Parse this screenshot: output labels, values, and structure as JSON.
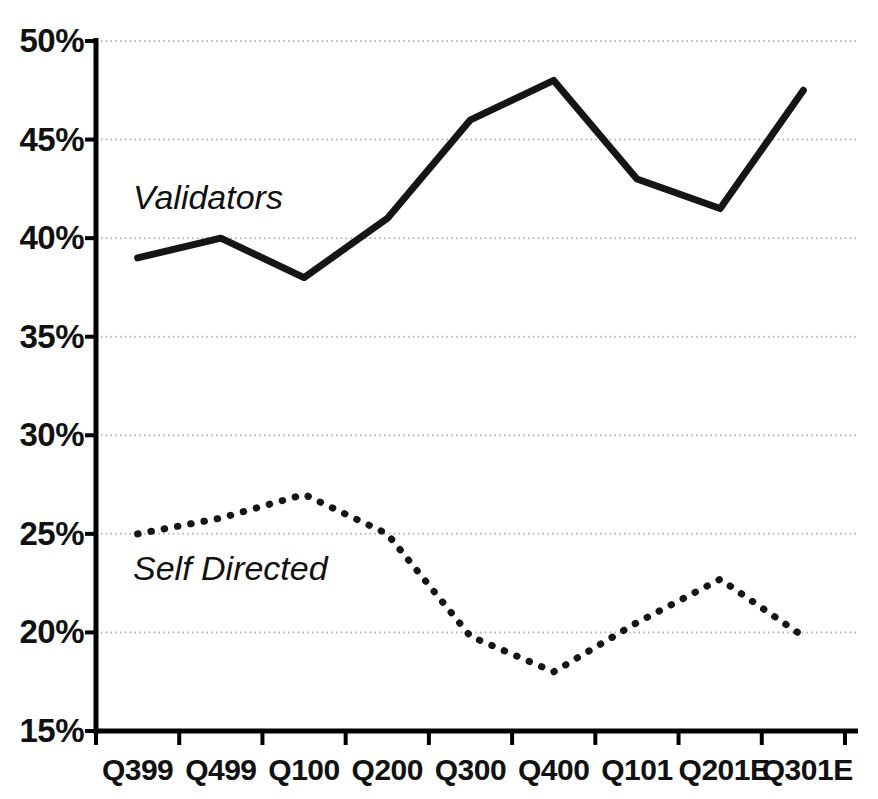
{
  "chart_data": {
    "type": "line",
    "title": "",
    "subtitle": "",
    "xlabel": "",
    "ylabel": "",
    "categories": [
      "Q399",
      "Q499",
      "Q100",
      "Q200",
      "Q300",
      "Q400",
      "Q101",
      "Q201E",
      "Q301E"
    ],
    "ylim": [
      15,
      50
    ],
    "ytick_labels": [
      "50%",
      "45%",
      "40%",
      "35%",
      "30%",
      "25%",
      "20%",
      "15%"
    ],
    "ytick_values": [
      50,
      45,
      40,
      35,
      30,
      25,
      20,
      15
    ],
    "ytick_suffix": "%",
    "grid": true,
    "grid_style": "dotted",
    "grid_color": "#bfbfbf",
    "legend_position": "inline-annotation",
    "axis_color": "#000000",
    "series": [
      {
        "name": "Validators",
        "style": "solid",
        "color": "#151515",
        "line_width": 7,
        "label_x_category": "Q499",
        "values": [
          39,
          40,
          38,
          41,
          46,
          48,
          43,
          41.5,
          47.5
        ]
      },
      {
        "name": "Self Directed",
        "style": "dotted",
        "color": "#151515",
        "line_width": 7,
        "label_x_category": "Q499",
        "values": [
          25,
          25.8,
          27,
          25,
          19.8,
          18,
          20.5,
          22.7,
          19.8
        ]
      }
    ]
  },
  "axis": {
    "y_labels": [
      "50%",
      "45%",
      "40%",
      "35%",
      "30%",
      "25%",
      "20%",
      "15%"
    ],
    "x_labels": [
      "Q399",
      "Q499",
      "Q100",
      "Q200",
      "Q300",
      "Q400",
      "Q101",
      "Q201E",
      "Q301E"
    ]
  },
  "annotations": {
    "validators": "Validators",
    "self_directed": "Self Directed"
  }
}
